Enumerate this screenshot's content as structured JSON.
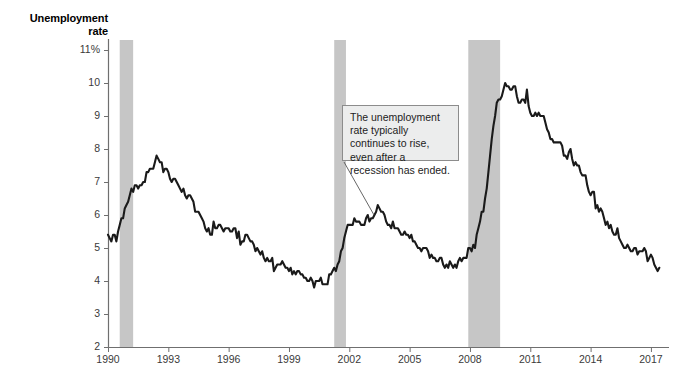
{
  "chart_data": {
    "type": "line",
    "title": "Unemployment rate",
    "xlabel": "",
    "ylabel": "Unemployment rate",
    "ylim": [
      2,
      11
    ],
    "xlim": [
      1990,
      2017.6
    ],
    "y_unit": "%",
    "grid": false,
    "legend": null,
    "y_ticks": [
      "11%",
      "10",
      "9",
      "8",
      "7",
      "6",
      "5",
      "4",
      "3",
      "2"
    ],
    "y_tick_values": [
      11,
      10,
      9,
      8,
      7,
      6,
      5,
      4,
      3,
      2
    ],
    "x_ticks": [
      "1990",
      "1993",
      "1996",
      "1999",
      "2002",
      "2005",
      "2008",
      "2011",
      "2014",
      "2017"
    ],
    "x_tick_values": [
      1990,
      1993,
      1996,
      1999,
      2002,
      2005,
      2008,
      2011,
      2014,
      2017
    ],
    "series": [
      {
        "name": "Unemployment rate",
        "color": "#1a1a1a",
        "x": [
          1990.0,
          1990.083,
          1990.167,
          1990.25,
          1990.333,
          1990.417,
          1990.5,
          1990.583,
          1990.667,
          1990.75,
          1990.833,
          1990.917,
          1991.0,
          1991.083,
          1991.167,
          1991.25,
          1991.333,
          1991.417,
          1991.5,
          1991.583,
          1991.667,
          1991.75,
          1991.833,
          1991.917,
          1992.0,
          1992.083,
          1992.167,
          1992.25,
          1992.333,
          1992.417,
          1992.5,
          1992.583,
          1992.667,
          1992.75,
          1992.833,
          1992.917,
          1993.0,
          1993.083,
          1993.167,
          1993.25,
          1993.333,
          1993.417,
          1993.5,
          1993.583,
          1993.667,
          1993.75,
          1993.833,
          1993.917,
          1994.0,
          1994.083,
          1994.167,
          1994.25,
          1994.333,
          1994.417,
          1994.5,
          1994.583,
          1994.667,
          1994.75,
          1994.833,
          1994.917,
          1995.0,
          1995.083,
          1995.167,
          1995.25,
          1995.333,
          1995.417,
          1995.5,
          1995.583,
          1995.667,
          1995.75,
          1995.833,
          1995.917,
          1996.0,
          1996.083,
          1996.167,
          1996.25,
          1996.333,
          1996.417,
          1996.5,
          1996.583,
          1996.667,
          1996.75,
          1996.833,
          1996.917,
          1997.0,
          1997.083,
          1997.167,
          1997.25,
          1997.333,
          1997.417,
          1997.5,
          1997.583,
          1997.667,
          1997.75,
          1997.833,
          1997.917,
          1998.0,
          1998.083,
          1998.167,
          1998.25,
          1998.333,
          1998.417,
          1998.5,
          1998.583,
          1998.667,
          1998.75,
          1998.833,
          1998.917,
          1999.0,
          1999.083,
          1999.167,
          1999.25,
          1999.333,
          1999.417,
          1999.5,
          1999.583,
          1999.667,
          1999.75,
          1999.833,
          1999.917,
          2000.0,
          2000.083,
          2000.167,
          2000.25,
          2000.333,
          2000.417,
          2000.5,
          2000.583,
          2000.667,
          2000.75,
          2000.833,
          2000.917,
          2001.0,
          2001.083,
          2001.167,
          2001.25,
          2001.333,
          2001.417,
          2001.5,
          2001.583,
          2001.667,
          2001.75,
          2001.833,
          2001.917,
          2002.0,
          2002.083,
          2002.167,
          2002.25,
          2002.333,
          2002.417,
          2002.5,
          2002.583,
          2002.667,
          2002.75,
          2002.833,
          2002.917,
          2003.0,
          2003.083,
          2003.167,
          2003.25,
          2003.333,
          2003.417,
          2003.5,
          2003.583,
          2003.667,
          2003.75,
          2003.833,
          2003.917,
          2004.0,
          2004.083,
          2004.167,
          2004.25,
          2004.333,
          2004.417,
          2004.5,
          2004.583,
          2004.667,
          2004.75,
          2004.833,
          2004.917,
          2005.0,
          2005.083,
          2005.167,
          2005.25,
          2005.333,
          2005.417,
          2005.5,
          2005.583,
          2005.667,
          2005.75,
          2005.833,
          2005.917,
          2006.0,
          2006.083,
          2006.167,
          2006.25,
          2006.333,
          2006.417,
          2006.5,
          2006.583,
          2006.667,
          2006.75,
          2006.833,
          2006.917,
          2007.0,
          2007.083,
          2007.167,
          2007.25,
          2007.333,
          2007.417,
          2007.5,
          2007.583,
          2007.667,
          2007.75,
          2007.833,
          2007.917,
          2008.0,
          2008.083,
          2008.167,
          2008.25,
          2008.333,
          2008.417,
          2008.5,
          2008.583,
          2008.667,
          2008.75,
          2008.833,
          2008.917,
          2009.0,
          2009.083,
          2009.167,
          2009.25,
          2009.333,
          2009.417,
          2009.5,
          2009.583,
          2009.667,
          2009.75,
          2009.833,
          2009.917,
          2010.0,
          2010.083,
          2010.167,
          2010.25,
          2010.333,
          2010.417,
          2010.5,
          2010.583,
          2010.667,
          2010.75,
          2010.833,
          2010.917,
          2011.0,
          2011.083,
          2011.167,
          2011.25,
          2011.333,
          2011.417,
          2011.5,
          2011.583,
          2011.667,
          2011.75,
          2011.833,
          2011.917,
          2012.0,
          2012.083,
          2012.167,
          2012.25,
          2012.333,
          2012.417,
          2012.5,
          2012.583,
          2012.667,
          2012.75,
          2012.833,
          2012.917,
          2013.0,
          2013.083,
          2013.167,
          2013.25,
          2013.333,
          2013.417,
          2013.5,
          2013.583,
          2013.667,
          2013.75,
          2013.833,
          2013.917,
          2014.0,
          2014.083,
          2014.167,
          2014.25,
          2014.333,
          2014.417,
          2014.5,
          2014.583,
          2014.667,
          2014.75,
          2014.833,
          2014.917,
          2015.0,
          2015.083,
          2015.167,
          2015.25,
          2015.333,
          2015.417,
          2015.5,
          2015.583,
          2015.667,
          2015.75,
          2015.833,
          2015.917,
          2016.0,
          2016.083,
          2016.167,
          2016.25,
          2016.333,
          2016.417,
          2016.5,
          2016.583,
          2016.667,
          2016.75,
          2016.833,
          2016.917,
          2017.0,
          2017.083,
          2017.167,
          2017.25,
          2017.333,
          2017.417
        ],
        "values": [
          5.4,
          5.3,
          5.2,
          5.4,
          5.4,
          5.2,
          5.5,
          5.7,
          5.9,
          5.9,
          6.2,
          6.3,
          6.4,
          6.6,
          6.8,
          6.7,
          6.9,
          6.9,
          6.8,
          6.9,
          6.9,
          7.0,
          7.0,
          7.3,
          7.3,
          7.4,
          7.4,
          7.4,
          7.6,
          7.8,
          7.7,
          7.6,
          7.6,
          7.3,
          7.4,
          7.4,
          7.3,
          7.1,
          7.0,
          7.1,
          7.1,
          7.0,
          6.9,
          6.8,
          6.7,
          6.8,
          6.6,
          6.5,
          6.6,
          6.6,
          6.5,
          6.4,
          6.1,
          6.1,
          6.1,
          6.0,
          5.9,
          5.8,
          5.6,
          5.5,
          5.6,
          5.4,
          5.4,
          5.8,
          5.6,
          5.6,
          5.7,
          5.7,
          5.6,
          5.5,
          5.6,
          5.6,
          5.6,
          5.5,
          5.5,
          5.6,
          5.6,
          5.3,
          5.5,
          5.1,
          5.2,
          5.2,
          5.4,
          5.4,
          5.3,
          5.2,
          5.2,
          5.1,
          4.9,
          5.0,
          4.9,
          4.8,
          4.9,
          4.7,
          4.6,
          4.7,
          4.6,
          4.6,
          4.7,
          4.3,
          4.4,
          4.5,
          4.5,
          4.5,
          4.6,
          4.5,
          4.4,
          4.4,
          4.3,
          4.4,
          4.2,
          4.3,
          4.2,
          4.3,
          4.3,
          4.2,
          4.2,
          4.1,
          4.1,
          4.0,
          4.0,
          4.1,
          4.0,
          3.8,
          4.0,
          4.0,
          4.0,
          4.1,
          3.9,
          3.9,
          3.9,
          3.9,
          4.2,
          4.2,
          4.3,
          4.4,
          4.3,
          4.5,
          4.6,
          4.9,
          5.0,
          5.3,
          5.5,
          5.7,
          5.7,
          5.7,
          5.7,
          5.9,
          5.8,
          5.8,
          5.8,
          5.7,
          5.7,
          5.7,
          5.9,
          6.0,
          5.8,
          5.9,
          5.9,
          6.0,
          6.1,
          6.3,
          6.2,
          6.1,
          6.1,
          6.0,
          5.8,
          5.7,
          5.7,
          5.6,
          5.8,
          5.6,
          5.6,
          5.6,
          5.5,
          5.4,
          5.4,
          5.5,
          5.4,
          5.4,
          5.3,
          5.4,
          5.2,
          5.2,
          5.1,
          5.0,
          5.0,
          4.9,
          5.0,
          5.0,
          5.0,
          4.9,
          4.7,
          4.8,
          4.7,
          4.7,
          4.6,
          4.6,
          4.7,
          4.7,
          4.5,
          4.4,
          4.5,
          4.4,
          4.6,
          4.5,
          4.4,
          4.5,
          4.4,
          4.6,
          4.7,
          4.6,
          4.7,
          4.7,
          4.7,
          5.0,
          5.0,
          4.9,
          5.1,
          5.0,
          5.4,
          5.6,
          5.8,
          6.1,
          6.1,
          6.5,
          6.8,
          7.3,
          7.8,
          8.3,
          8.7,
          9.0,
          9.4,
          9.5,
          9.5,
          9.6,
          9.8,
          10.0,
          9.9,
          9.9,
          9.8,
          9.8,
          9.9,
          9.9,
          9.6,
          9.4,
          9.4,
          9.5,
          9.5,
          9.4,
          9.8,
          9.3,
          9.1,
          9.0,
          9.0,
          9.1,
          9.0,
          9.1,
          9.0,
          9.0,
          9.0,
          8.8,
          8.6,
          8.5,
          8.3,
          8.3,
          8.2,
          8.2,
          8.2,
          8.2,
          8.2,
          8.1,
          7.8,
          7.8,
          7.7,
          7.9,
          8.0,
          7.7,
          7.5,
          7.6,
          7.5,
          7.5,
          7.3,
          7.2,
          7.2,
          7.2,
          6.9,
          6.7,
          6.6,
          6.7,
          6.7,
          6.2,
          6.3,
          6.1,
          6.2,
          6.1,
          5.9,
          5.7,
          5.8,
          5.6,
          5.7,
          5.5,
          5.4,
          5.4,
          5.6,
          5.3,
          5.2,
          5.1,
          5.0,
          5.0,
          5.1,
          5.0,
          4.9,
          4.9,
          5.0,
          5.0,
          4.8,
          4.9,
          4.9,
          4.9,
          5.0,
          4.9,
          4.6,
          4.7,
          4.8,
          4.7,
          4.5,
          4.4,
          4.3,
          4.4
        ]
      }
    ],
    "recession_bands": [
      {
        "label": "1990-91 recession",
        "start": 1990.583,
        "end": 1991.25,
        "color": "#c6c6c6"
      },
      {
        "label": "2001 recession",
        "start": 2001.25,
        "end": 2001.833,
        "color": "#c6c6c6"
      },
      {
        "label": "2007-09 recession",
        "start": 2007.917,
        "end": 2009.5,
        "color": "#c6c6c6"
      }
    ],
    "annotations": [
      {
        "text": "The unemployment rate typically continues to rise, even after a recession has ended.",
        "box": {
          "x": 342,
          "y": 105,
          "width": 117,
          "height": 56
        },
        "leader": {
          "x1": 344,
          "y1": 162,
          "x2": 374,
          "y2": 215
        }
      }
    ]
  },
  "axis": {
    "title_line1": "Unemployment",
    "title_line2": "rate"
  }
}
